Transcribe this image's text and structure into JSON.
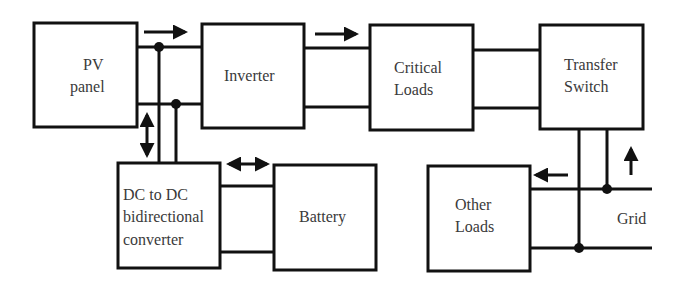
{
  "diagram": {
    "type": "block-diagram",
    "blocks": {
      "pv_panel": {
        "lines": [
          "PV",
          "panel"
        ]
      },
      "inverter": {
        "lines": [
          "Inverter"
        ]
      },
      "critical_loads": {
        "lines": [
          "Critical",
          "Loads"
        ]
      },
      "transfer_switch": {
        "lines": [
          "Transfer",
          "Switch"
        ]
      },
      "dc_dc_converter": {
        "lines": [
          "DC to DC",
          "bidirectional",
          "converter"
        ]
      },
      "battery": {
        "lines": [
          "Battery"
        ]
      },
      "other_loads": {
        "lines": [
          "Other",
          "Loads"
        ]
      }
    },
    "grid_label": "Grid",
    "connections": [
      {
        "from": "PV panel",
        "to": "Inverter",
        "arrow": "right"
      },
      {
        "from": "PV panel bus",
        "to": "DC to DC bidirectional converter",
        "arrow": "bidirectional-vertical"
      },
      {
        "from": "Inverter",
        "to": "Critical Loads",
        "arrow": "right"
      },
      {
        "from": "Critical Loads",
        "to": "Transfer Switch",
        "arrow": "none"
      },
      {
        "from": "DC to DC bidirectional converter",
        "to": "Battery",
        "arrow": "bidirectional-horizontal"
      },
      {
        "from": "Grid",
        "to": "Transfer Switch",
        "arrow": "up"
      },
      {
        "from": "Grid",
        "to": "Other Loads",
        "arrow": "left"
      }
    ],
    "colors": {
      "line": "#111111",
      "text": "#3a3a3a",
      "background": "#ffffff"
    }
  }
}
